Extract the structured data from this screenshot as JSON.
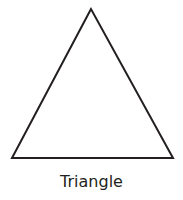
{
  "shape": {
    "type": "triangle",
    "stroke_color": "#231f20",
    "fill_color": "#ffffff",
    "stroke_width": 2,
    "vertices": [
      [
        91,
        9
      ],
      [
        12,
        158
      ],
      [
        173,
        158
      ]
    ]
  },
  "label": "Triangle"
}
